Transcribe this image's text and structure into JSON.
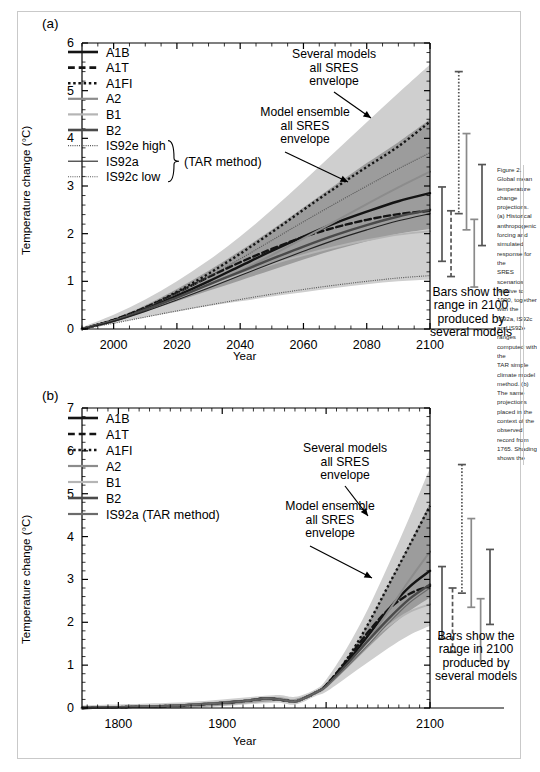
{
  "figure": {
    "panels": [
      {
        "tag": "(a)",
        "ylabel": "Temperature change (°C)",
        "xlabel": "Year",
        "yticks": [
          0,
          1,
          2,
          3,
          4,
          5,
          6
        ],
        "xticks": [
          2000,
          2020,
          2040,
          2060,
          2080,
          2100
        ],
        "annotation_several": "Several models\nall SRES\nenvelope",
        "annotation_ensemble": "Model ensemble\nall SRES\nenvelope",
        "bars_note": "Bars show the\nrange in 2100\nproduced by\nseveral models",
        "legend": [
          {
            "label": "A1B",
            "style": "solid",
            "color": "#141414",
            "width": 2.6
          },
          {
            "label": "A1T",
            "style": "dashed",
            "color": "#141414",
            "width": 2.6
          },
          {
            "label": "A1FI",
            "style": "dotted",
            "color": "#141414",
            "width": 2.6
          },
          {
            "label": "A2",
            "style": "solid",
            "color": "#8c8c8c",
            "width": 2.2
          },
          {
            "label": "B1",
            "style": "solid",
            "color": "#b5b5b5",
            "width": 2.2
          },
          {
            "label": "B2",
            "style": "solid",
            "color": "#4a4a4a",
            "width": 2.6
          },
          {
            "label": "IS92e high",
            "style": "dotted",
            "color": "#555555",
            "width": 1.1
          },
          {
            "label": "IS92a",
            "style": "solid",
            "color": "#222222",
            "width": 1.1
          },
          {
            "label": "IS92c low",
            "style": "dotted",
            "color": "#555555",
            "width": 1.1
          }
        ],
        "legend_brace_label": "(TAR method)"
      },
      {
        "tag": "(b)",
        "ylabel": "Temperature change (°C)",
        "xlabel": "Year",
        "yticks": [
          0,
          1,
          2,
          3,
          4,
          5,
          6,
          7
        ],
        "xticks": [
          1800,
          1900,
          2000,
          2100
        ],
        "annotation_several": "Several models\nall SRES\nenvelope",
        "annotation_ensemble": "Model ensemble\nall SRES\nenvelope",
        "bars_note": "Bars show the\nrange in 2100\nproduced by\nseveral models",
        "legend": [
          {
            "label": "A1B",
            "style": "solid",
            "color": "#141414",
            "width": 2.6
          },
          {
            "label": "A1T",
            "style": "dashed",
            "color": "#141414",
            "width": 2.6
          },
          {
            "label": "A1FI",
            "style": "dotted",
            "color": "#141414",
            "width": 2.6
          },
          {
            "label": "A2",
            "style": "solid",
            "color": "#8c8c8c",
            "width": 2.2
          },
          {
            "label": "B1",
            "style": "solid",
            "color": "#b5b5b5",
            "width": 2.2
          },
          {
            "label": "B2",
            "style": "solid",
            "color": "#4a4a4a",
            "width": 2.6
          },
          {
            "label": "IS92a (TAR method)",
            "style": "solid",
            "color": "#6b6b6b",
            "width": 2.2
          }
        ]
      }
    ],
    "colors": {
      "outer_envelope": "#cfcfcf",
      "ensemble_envelope": "#9c9c9c",
      "axis": "#000000",
      "frame": "#c9c9c9",
      "text": "#000000"
    },
    "side_caption_lines": [
      "Figure 2. Global mean",
      "temperature change",
      "projections. (a) Historical",
      "anthropogenic forcing and",
      "simulated response for the",
      "SRES scenarios relative to",
      "1990, together with the",
      "IS92a, IS92c and IS92e",
      "ranges computed with the",
      "TAR simple climate model",
      "method. (b) The same",
      "projections placed in the",
      "context of the observed",
      "record from 1765. Shading",
      "shows the envelope of all",
      "SRES scenarios across",
      "several models, and the",
      "darker band the model",
      "ensemble across all SRES",
      "scenarios. Bars at the right",
      "of each panel show the",
      "range in 2100 produced by",
      "several models for the",
      "six illustrative scenarios."
    ]
  },
  "chart_data": [
    {
      "type": "line",
      "panel": "(a)",
      "title": "",
      "xlabel": "Year",
      "ylabel": "Temperature change (°C)",
      "xlim": [
        1990,
        2100
      ],
      "ylim": [
        0,
        6
      ],
      "grid": false,
      "legend_position": "upper-left",
      "x": [
        1990,
        2000,
        2010,
        2020,
        2030,
        2040,
        2050,
        2060,
        2070,
        2080,
        2090,
        2100
      ],
      "series": [
        {
          "name": "A1B",
          "style": "solid",
          "color": "#141414",
          "values": [
            0.0,
            0.18,
            0.42,
            0.7,
            1.0,
            1.32,
            1.64,
            1.94,
            2.22,
            2.46,
            2.68,
            2.85
          ]
        },
        {
          "name": "A1T",
          "style": "dashed",
          "color": "#141414",
          "values": [
            0.0,
            0.19,
            0.45,
            0.76,
            1.09,
            1.4,
            1.68,
            1.93,
            2.13,
            2.29,
            2.41,
            2.48
          ]
        },
        {
          "name": "A1FI",
          "style": "dotted",
          "color": "#141414",
          "values": [
            0.0,
            0.19,
            0.45,
            0.78,
            1.16,
            1.58,
            2.03,
            2.5,
            2.96,
            3.4,
            3.83,
            4.35
          ]
        },
        {
          "name": "A2",
          "style": "solid",
          "color": "#8c8c8c",
          "values": [
            0.0,
            0.17,
            0.39,
            0.64,
            0.92,
            1.22,
            1.55,
            1.9,
            2.26,
            2.62,
            2.97,
            3.3
          ]
        },
        {
          "name": "B1",
          "style": "solid",
          "color": "#b5b5b5",
          "values": [
            0.0,
            0.17,
            0.39,
            0.64,
            0.9,
            1.14,
            1.36,
            1.55,
            1.72,
            1.86,
            1.98,
            2.05
          ]
        },
        {
          "name": "B2",
          "style": "solid",
          "color": "#4a4a4a",
          "values": [
            0.0,
            0.17,
            0.4,
            0.66,
            0.93,
            1.2,
            1.47,
            1.73,
            1.97,
            2.18,
            2.36,
            2.5
          ]
        },
        {
          "name": "IS92e high",
          "style": "dotted",
          "color": "#555555",
          "values": [
            0.0,
            0.18,
            0.44,
            0.75,
            1.1,
            1.47,
            1.86,
            2.25,
            2.63,
            3.0,
            3.36,
            3.7
          ]
        },
        {
          "name": "IS92a",
          "style": "solid",
          "color": "#222222",
          "values": [
            0.0,
            0.16,
            0.37,
            0.61,
            0.86,
            1.12,
            1.38,
            1.63,
            1.87,
            2.08,
            2.27,
            2.42
          ]
        },
        {
          "name": "IS92c low",
          "style": "dotted",
          "color": "#555555",
          "values": [
            0.0,
            0.12,
            0.25,
            0.38,
            0.5,
            0.62,
            0.73,
            0.83,
            0.92,
            1.0,
            1.07,
            1.12
          ]
        }
      ],
      "bands": [
        {
          "name": "Several models all SRES envelope",
          "color": "#cfcfcf",
          "x": [
            1990,
            2000,
            2010,
            2020,
            2030,
            2040,
            2050,
            2060,
            2070,
            2080,
            2090,
            2100
          ],
          "upper": [
            0.04,
            0.3,
            0.62,
            1.0,
            1.44,
            1.94,
            2.5,
            3.1,
            3.72,
            4.34,
            4.95,
            5.55
          ],
          "lower": [
            0.0,
            0.12,
            0.24,
            0.36,
            0.48,
            0.58,
            0.68,
            0.77,
            0.86,
            0.94,
            1.0,
            1.04
          ]
        },
        {
          "name": "Model ensemble all SRES envelope",
          "color": "#9c9c9c",
          "x": [
            1990,
            2000,
            2010,
            2020,
            2030,
            2040,
            2050,
            2060,
            2070,
            2080,
            2090,
            2100
          ],
          "upper": [
            0.02,
            0.22,
            0.5,
            0.84,
            1.22,
            1.64,
            2.08,
            2.55,
            3.02,
            3.48,
            3.92,
            4.4
          ],
          "lower": [
            0.0,
            0.16,
            0.36,
            0.58,
            0.8,
            1.02,
            1.24,
            1.46,
            1.66,
            1.84,
            2.0,
            2.1
          ]
        }
      ],
      "bars_2100": [
        {
          "name": "A1B",
          "style": "solid",
          "color": "#555555",
          "x": 2112,
          "low": 1.42,
          "high": 2.98
        },
        {
          "name": "A1T",
          "style": "dashed",
          "color": "#555555",
          "x": 2119,
          "low": 1.1,
          "high": 2.48
        },
        {
          "name": "A1FI",
          "style": "dotted",
          "color": "#555555",
          "x": 2125,
          "low": 2.42,
          "high": 5.4
        },
        {
          "name": "A2",
          "style": "solid",
          "color": "#8a8a8a",
          "x": 2131,
          "low": 2.08,
          "high": 4.1
        },
        {
          "name": "B1",
          "style": "solid",
          "color": "#8a8a8a",
          "x": 2137,
          "low": 0.88,
          "high": 2.3
        },
        {
          "name": "B2",
          "style": "solid",
          "color": "#555555",
          "x": 2143,
          "low": 1.75,
          "high": 3.45
        }
      ]
    },
    {
      "type": "line",
      "panel": "(b)",
      "title": "",
      "xlabel": "Year",
      "ylabel": "Temperature change (°C)",
      "xlim": [
        1765,
        2100
      ],
      "ylim": [
        0,
        7
      ],
      "grid": false,
      "legend_position": "upper-left",
      "x": [
        1765,
        1800,
        1850,
        1900,
        1920,
        1940,
        1950,
        1960,
        1970,
        1980,
        1990,
        2000,
        2020,
        2040,
        2060,
        2080,
        2100
      ],
      "series": [
        {
          "name": "A1B",
          "style": "solid",
          "color": "#141414",
          "values": [
            0.0,
            0.02,
            0.05,
            0.12,
            0.16,
            0.22,
            0.21,
            0.18,
            0.15,
            0.24,
            0.36,
            0.52,
            1.06,
            1.68,
            2.3,
            2.82,
            3.2
          ]
        },
        {
          "name": "A1T",
          "style": "dashed",
          "color": "#141414",
          "values": [
            0.0,
            0.02,
            0.05,
            0.12,
            0.16,
            0.22,
            0.21,
            0.18,
            0.15,
            0.24,
            0.36,
            0.53,
            1.12,
            1.76,
            2.3,
            2.66,
            2.85
          ]
        },
        {
          "name": "A1FI",
          "style": "dotted",
          "color": "#141414",
          "values": [
            0.0,
            0.02,
            0.05,
            0.12,
            0.16,
            0.22,
            0.21,
            0.18,
            0.15,
            0.24,
            0.36,
            0.53,
            1.14,
            1.94,
            2.86,
            3.78,
            4.72
          ]
        },
        {
          "name": "A2",
          "style": "solid",
          "color": "#8c8c8c",
          "values": [
            0.0,
            0.02,
            0.05,
            0.12,
            0.16,
            0.22,
            0.21,
            0.18,
            0.15,
            0.24,
            0.36,
            0.51,
            1.0,
            1.58,
            2.26,
            2.98,
            3.65
          ]
        },
        {
          "name": "B1",
          "style": "solid",
          "color": "#b5b5b5",
          "values": [
            0.0,
            0.02,
            0.05,
            0.12,
            0.16,
            0.22,
            0.21,
            0.18,
            0.15,
            0.24,
            0.36,
            0.51,
            1.0,
            1.5,
            1.92,
            2.24,
            2.42
          ]
        },
        {
          "name": "B2",
          "style": "solid",
          "color": "#4a4a4a",
          "values": [
            0.0,
            0.02,
            0.05,
            0.12,
            0.16,
            0.22,
            0.21,
            0.18,
            0.15,
            0.24,
            0.36,
            0.51,
            1.02,
            1.56,
            2.08,
            2.54,
            2.88
          ]
        },
        {
          "name": "IS92a (TAR method)",
          "style": "solid",
          "color": "#6b6b6b",
          "values": [
            0.0,
            0.02,
            0.05,
            0.12,
            0.16,
            0.22,
            0.21,
            0.18,
            0.15,
            0.24,
            0.36,
            0.5,
            0.96,
            1.46,
            1.98,
            2.45,
            2.8
          ]
        }
      ],
      "bands": [
        {
          "name": "Several models all SRES envelope",
          "color": "#cfcfcf",
          "x": [
            1765,
            1850,
            1900,
            1950,
            1970,
            1990,
            2000,
            2020,
            2040,
            2060,
            2080,
            2100
          ],
          "upper": [
            0.06,
            0.12,
            0.2,
            0.3,
            0.26,
            0.44,
            0.66,
            1.4,
            2.3,
            3.34,
            4.44,
            5.6
          ],
          "lower": [
            0.0,
            -0.02,
            0.04,
            0.12,
            0.08,
            0.28,
            0.38,
            0.72,
            1.06,
            1.4,
            1.7,
            1.92
          ]
        },
        {
          "name": "Model ensemble all SRES envelope",
          "color": "#9c9c9c",
          "x": [
            1765,
            1850,
            1900,
            1950,
            1970,
            1990,
            2000,
            2020,
            2040,
            2060,
            2080,
            2100
          ],
          "upper": [
            0.03,
            0.08,
            0.16,
            0.25,
            0.21,
            0.4,
            0.58,
            1.16,
            1.96,
            2.88,
            3.82,
            4.78
          ],
          "lower": [
            0.0,
            0.0,
            0.06,
            0.16,
            0.12,
            0.32,
            0.46,
            0.92,
            1.4,
            1.86,
            2.26,
            2.58
          ]
        }
      ],
      "bars_2100": [
        {
          "name": "A1B",
          "style": "solid",
          "color": "#555555",
          "x": 2122,
          "low": 1.62,
          "high": 3.3
        },
        {
          "name": "A1T",
          "style": "dashed",
          "color": "#555555",
          "x": 2140,
          "low": 1.3,
          "high": 2.8
        },
        {
          "name": "A1FI",
          "style": "dotted",
          "color": "#555555",
          "x": 2156,
          "low": 2.68,
          "high": 5.68
        },
        {
          "name": "A2",
          "style": "solid",
          "color": "#8a8a8a",
          "x": 2172,
          "low": 2.35,
          "high": 4.42
        },
        {
          "name": "B1",
          "style": "solid",
          "color": "#8a8a8a",
          "x": 2188,
          "low": 1.1,
          "high": 2.55
        },
        {
          "name": "B2",
          "style": "solid",
          "color": "#555555",
          "x": 2204,
          "low": 1.95,
          "high": 3.7
        }
      ]
    }
  ]
}
